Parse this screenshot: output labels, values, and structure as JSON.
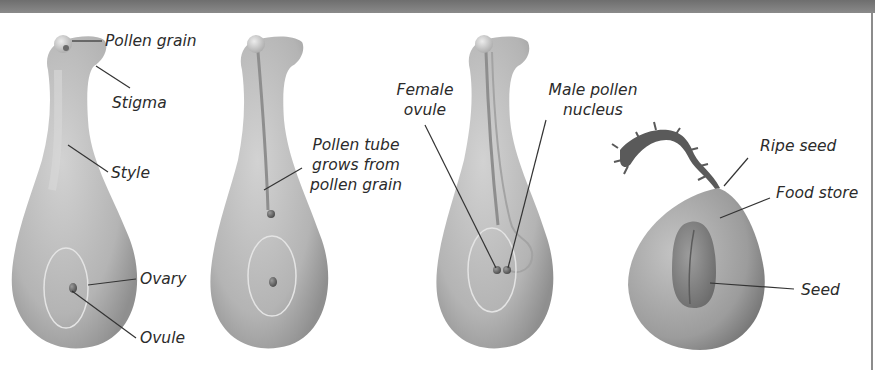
{
  "diagram": {
    "colors": {
      "tissue": "#bdbdbd",
      "tissue_dark": "#8e8e8e",
      "tissue_light": "#dcdcdc",
      "leader_line": "#333333",
      "text": "#2b2b2b",
      "frame": "#7a7a7a"
    },
    "panels": [
      {
        "id": "pollination",
        "labels": {
          "pollen_grain": "Pollen grain",
          "stigma": "Stigma",
          "style": "Style",
          "ovary": "Ovary",
          "ovule": "Ovule"
        }
      },
      {
        "id": "pollen-tube-growth",
        "labels": {
          "pollen_tube_line1": "Pollen tube",
          "pollen_tube_line2": "grows from",
          "pollen_tube_line3": "pollen grain"
        }
      },
      {
        "id": "fertilisation",
        "labels": {
          "female_ovule_line1": "Female",
          "female_ovule_line2": "ovule",
          "male_nucleus_line1": "Male pollen",
          "male_nucleus_line2": "nucleus"
        }
      },
      {
        "id": "ripe-seed",
        "labels": {
          "ripe_seed": "Ripe seed",
          "food_store": "Food store",
          "seed": "Seed"
        }
      }
    ]
  }
}
